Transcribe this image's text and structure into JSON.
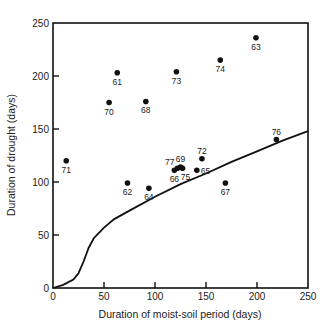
{
  "chart_data": {
    "type": "scatter",
    "title": "",
    "xlabel": "Duration of moist-soil period (days)",
    "ylabel": "Duration of drought (days)",
    "xlim": [
      0,
      250
    ],
    "ylim": [
      0,
      250
    ],
    "xticks": [
      "0",
      "50",
      "100",
      "150",
      "200",
      "250"
    ],
    "yticks": [
      "0",
      "50",
      "100",
      "150",
      "200",
      "250"
    ],
    "grid": false,
    "points": [
      {
        "label": "71",
        "x": 13,
        "y": 120
      },
      {
        "label": "61",
        "x": 63,
        "y": 203
      },
      {
        "label": "70",
        "x": 55,
        "y": 175
      },
      {
        "label": "68",
        "x": 91,
        "y": 176
      },
      {
        "label": "73",
        "x": 121,
        "y": 204
      },
      {
        "label": "74",
        "x": 164,
        "y": 215
      },
      {
        "label": "63",
        "x": 199,
        "y": 236
      },
      {
        "label": "76",
        "x": 219,
        "y": 140
      },
      {
        "label": "62",
        "x": 73,
        "y": 99
      },
      {
        "label": "64",
        "x": 94,
        "y": 94
      },
      {
        "label": "67",
        "x": 169,
        "y": 99
      },
      {
        "label": "66",
        "x": 119,
        "y": 111
      },
      {
        "label": "77",
        "x": 122,
        "y": 113
      },
      {
        "label": "69",
        "x": 125,
        "y": 114
      },
      {
        "label": "75",
        "x": 127,
        "y": 113
      },
      {
        "label": "72",
        "x": 146,
        "y": 122
      },
      {
        "label": "65",
        "x": 141,
        "y": 111
      }
    ],
    "curve": {
      "name": "threshold curve",
      "x": [
        0,
        10,
        20,
        25,
        30,
        35,
        40,
        50,
        60,
        75,
        100,
        125,
        150,
        175,
        200,
        225,
        250
      ],
      "y": [
        0,
        3,
        8,
        14,
        25,
        38,
        47,
        57,
        65,
        73,
        86,
        98,
        108,
        119,
        129,
        139,
        148
      ]
    }
  }
}
